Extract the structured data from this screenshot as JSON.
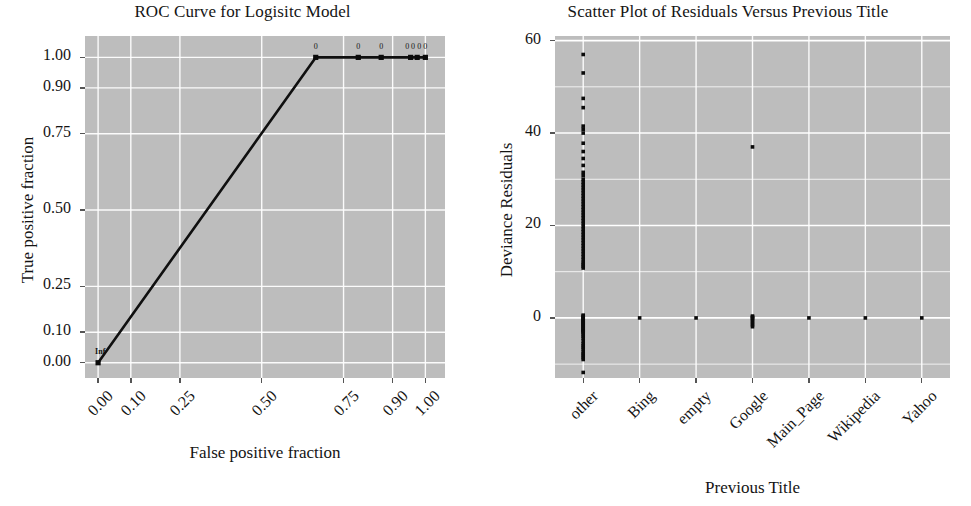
{
  "figure": {
    "width": 971,
    "height": 506,
    "background": "#ffffff",
    "panel_background": "#bdbdbd",
    "grid_color": "#ffffff",
    "ink_color": "#141414"
  },
  "roc": {
    "title": "ROC Curve for Logisitc Model",
    "xlabel": "False positive fraction",
    "ylabel": "True positive fraction",
    "origin_label": "Inf",
    "point_labels": [
      "0",
      "0",
      "0",
      "0",
      "0",
      "0",
      "0"
    ]
  },
  "residuals": {
    "title": "Scatter Plot of Residuals Versus Previous Title",
    "xlabel": "Previous Title",
    "ylabel": "Deviance Residuals"
  },
  "chart_data": [
    {
      "type": "line",
      "id": "roc-curve",
      "title": "ROC Curve for Logisitc Model",
      "xlabel": "False positive fraction",
      "ylabel": "True positive fraction",
      "xlim": [
        -0.04,
        1.06
      ],
      "ylim": [
        -0.05,
        1.07
      ],
      "xticks": [
        0.0,
        0.1,
        0.25,
        0.5,
        0.75,
        0.9,
        1.0
      ],
      "xticklabels": [
        "0.00",
        "0.10",
        "0.25",
        "0.50",
        "0.75",
        "0.90",
        "1.00"
      ],
      "yticks": [
        0.0,
        0.1,
        0.25,
        0.5,
        0.75,
        0.9,
        1.0
      ],
      "yticklabels": [
        "0.00",
        "0.10",
        "0.25",
        "0.50",
        "0.75",
        "0.90",
        "1.00"
      ],
      "grid": true,
      "legend": null,
      "x": [
        0.0,
        0.665,
        0.795,
        0.865,
        0.955,
        0.975,
        1.0
      ],
      "y": [
        0.0,
        1.0,
        1.0,
        1.0,
        1.0,
        1.0,
        1.0
      ],
      "annotations": [
        {
          "x": 0.0,
          "y": 0.0,
          "text": "Inf"
        },
        {
          "x": 0.665,
          "y": 1.0,
          "text": "0"
        },
        {
          "x": 0.795,
          "y": 1.0,
          "text": "0"
        },
        {
          "x": 0.865,
          "y": 1.0,
          "text": "0"
        },
        {
          "x": 0.945,
          "y": 1.0,
          "text": "0"
        },
        {
          "x": 0.962,
          "y": 1.0,
          "text": "0"
        },
        {
          "x": 0.981,
          "y": 1.0,
          "text": "0"
        },
        {
          "x": 1.0,
          "y": 1.0,
          "text": "0"
        }
      ]
    },
    {
      "type": "scatter",
      "id": "deviance-residuals",
      "title": "Scatter Plot of Residuals Versus Previous Title",
      "xlabel": "Previous Title",
      "ylabel": "Deviance Residuals",
      "categories": [
        "other",
        "Bing",
        "empty",
        "Google",
        "Main_Page",
        "Wikipedia",
        "Yahoo"
      ],
      "yticks": [
        0,
        20,
        40,
        60
      ],
      "yticklabels": [
        "0",
        "20",
        "40",
        "60"
      ],
      "ylim": [
        -13,
        61
      ],
      "grid": true,
      "legend": null,
      "series": [
        {
          "name": "other",
          "values": [
            57.0,
            53.0,
            47.5,
            45.5,
            41.5,
            40.8,
            40.0,
            37.8,
            36.0,
            34.5,
            33.0,
            31.5,
            30.8,
            30.0,
            29.4,
            28.8,
            28.2,
            27.6,
            27.0,
            26.4,
            25.8,
            25.2,
            24.6,
            24.0,
            23.4,
            22.8,
            22.2,
            21.6,
            21.0,
            20.4,
            19.8,
            19.2,
            18.6,
            18.0,
            17.4,
            16.8,
            16.2,
            15.6,
            15.0,
            14.4,
            13.8,
            13.2,
            12.6,
            12.0,
            11.6,
            11.2,
            10.8,
            0.6,
            0.4,
            0.2,
            0.0,
            -0.2,
            -0.4,
            -0.6,
            -0.8,
            -1.0,
            -1.2,
            -1.4,
            -1.6,
            -1.8,
            -2.0,
            -2.2,
            -2.4,
            -2.6,
            -2.8,
            -3.0,
            -3.2,
            -3.6,
            -4.0,
            -4.4,
            -5.0,
            -5.6,
            -6.0,
            -6.4,
            -6.8,
            -7.4,
            -7.8,
            -8.2,
            -8.6,
            -9.0,
            -11.8
          ]
        },
        {
          "name": "Bing",
          "values": [
            0.0
          ]
        },
        {
          "name": "empty",
          "values": [
            0.0
          ]
        },
        {
          "name": "Google",
          "values": [
            37.0,
            0.4,
            0.2,
            0.0,
            -0.3,
            -0.7,
            -1.1,
            -1.5,
            -1.9
          ]
        },
        {
          "name": "Main_Page",
          "values": [
            0.0
          ]
        },
        {
          "name": "Wikipedia",
          "values": [
            0.0
          ]
        },
        {
          "name": "Yahoo",
          "values": [
            0.0
          ]
        }
      ]
    }
  ]
}
